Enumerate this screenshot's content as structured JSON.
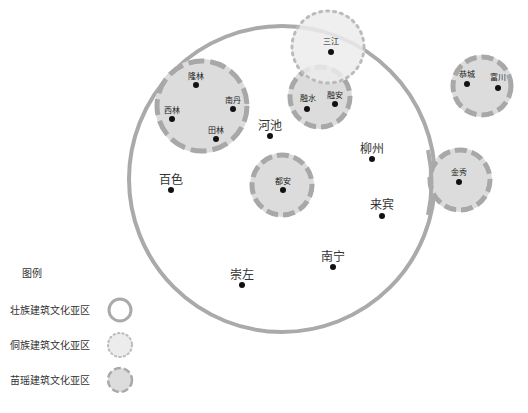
{
  "legend": {
    "title": "图例",
    "items": [
      {
        "label": "壮族建筑文化亚区",
        "style": "solid-ring"
      },
      {
        "label": "侗族建筑文化亚区",
        "style": "dotted-circle"
      },
      {
        "label": "苗瑶建筑文化亚区",
        "style": "dashed-circle"
      }
    ]
  },
  "colors": {
    "ring": "#aaaaaa",
    "fill": "#dcdcdc",
    "dong_fill": "#ececec",
    "dash": "#a8a8a8",
    "dot": "#000000",
    "text": "#333333"
  },
  "regions": {
    "zhuang": {
      "label": "壮族建筑文化亚区"
    },
    "miao_yao_groups": [
      {
        "name": "西北组",
        "cities": [
          "隆林",
          "西林",
          "南丹",
          "田林"
        ]
      },
      {
        "name": "融水组",
        "cities": [
          "融水",
          "融安"
        ]
      },
      {
        "name": "都安组",
        "cities": [
          "都安"
        ]
      },
      {
        "name": "东北组",
        "cities": [
          "恭城",
          "富川"
        ]
      },
      {
        "name": "金秀组",
        "cities": [
          "金秀"
        ]
      }
    ],
    "dong": {
      "cities": [
        "三江"
      ]
    }
  },
  "cities": {
    "longlin": "隆林",
    "xilin": "西林",
    "nandan": "南丹",
    "tianlin": "田林",
    "sanjiang": "三江",
    "rongshui": "融水",
    "rongan": "融安",
    "gongcheng": "恭城",
    "fuchuan": "富川",
    "jinxiu": "金秀",
    "duan": "都安",
    "hechi": "河池",
    "liuzhou": "柳州",
    "baise": "百色",
    "laibin": "来宾",
    "nanning": "南宁",
    "chongzuo": "崇左"
  }
}
